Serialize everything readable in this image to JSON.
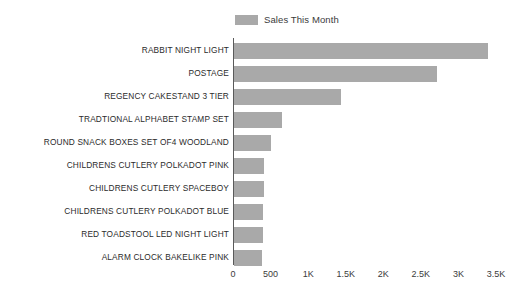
{
  "legend": {
    "entries": [
      {
        "label": "Sales This Month",
        "color": "#a9a9a9",
        "icon": "legend-swatch"
      }
    ]
  },
  "axis": {
    "x_tick_labels": [
      "0",
      "500",
      "1K",
      "1.5K",
      "2K",
      "2.5K",
      "3K",
      "3.5K"
    ],
    "x_tick_values": [
      0,
      500,
      1000,
      1500,
      2000,
      2500,
      3000,
      3500
    ]
  },
  "chart_data": {
    "type": "bar",
    "orientation": "horizontal",
    "title": "",
    "subtitle": "",
    "xlabel": "",
    "ylabel": "",
    "xlim": [
      0,
      3500
    ],
    "grid": false,
    "legend_position": "top-center",
    "bar_color": "#a9a9a9",
    "categories": [
      "RABBIT NIGHT LIGHT",
      "POSTAGE",
      "REGENCY CAKESTAND 3 TIER",
      "TRADTIONAL ALPHABET STAMP SET",
      "ROUND SNACK BOXES SET OF4 WOODLAND",
      "CHILDRENS CUTLERY POLKADOT PINK",
      "CHILDRENS CUTLERY SPACEBOY",
      "CHILDRENS CUTLERY POLKADOT BLUE",
      "RED TOADSTOOL LED NIGHT LIGHT",
      "ALARM CLOCK BAKELIKE PINK"
    ],
    "series": [
      {
        "name": "Sales This Month",
        "values": [
          3380,
          2700,
          1420,
          640,
          490,
          400,
          395,
          390,
          385,
          375
        ]
      }
    ]
  }
}
